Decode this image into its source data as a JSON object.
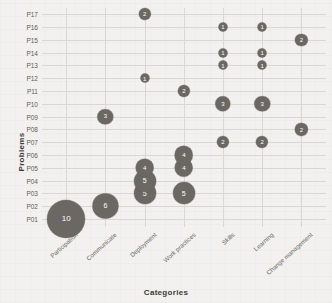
{
  "axis": {
    "y_title": "Problems",
    "x_title": "Categories"
  },
  "chart_data": {
    "type": "scatter",
    "title": "",
    "subtitle": "",
    "xlabel": "Categories",
    "ylabel": "Problems",
    "grid": true,
    "legend": null,
    "marker_style": "bubble-with-value-label",
    "marker_color": "#6b6864",
    "categories": [
      "Participation",
      "Communicate",
      "Deployment",
      "Work practices",
      "Skills",
      "Learning",
      "Change management"
    ],
    "problems": [
      "P01",
      "P02",
      "P03",
      "P04",
      "P05",
      "P06",
      "P07",
      "P08",
      "P09",
      "P10",
      "P11",
      "P12",
      "P13",
      "P14",
      "P15",
      "P16",
      "P17"
    ],
    "xlim": [
      "Participation",
      "Change management"
    ],
    "ylim": [
      "P01",
      "P17"
    ],
    "value_range": [
      1,
      10
    ],
    "points": [
      {
        "x": "Participation",
        "y": "P01",
        "value": 10
      },
      {
        "x": "Communicate",
        "y": "P02",
        "value": 6
      },
      {
        "x": "Communicate",
        "y": "P09",
        "value": 3
      },
      {
        "x": "Deployment",
        "y": "P03",
        "value": 5
      },
      {
        "x": "Deployment",
        "y": "P04",
        "value": 5
      },
      {
        "x": "Deployment",
        "y": "P05",
        "value": 4
      },
      {
        "x": "Deployment",
        "y": "P12",
        "value": 1
      },
      {
        "x": "Deployment",
        "y": "P17",
        "value": 2
      },
      {
        "x": "Work practices",
        "y": "P03",
        "value": 5
      },
      {
        "x": "Work practices",
        "y": "P05",
        "value": 4
      },
      {
        "x": "Work practices",
        "y": "P06",
        "value": 4
      },
      {
        "x": "Work practices",
        "y": "P11",
        "value": 2
      },
      {
        "x": "Skills",
        "y": "P07",
        "value": 2
      },
      {
        "x": "Skills",
        "y": "P10",
        "value": 3
      },
      {
        "x": "Skills",
        "y": "P13",
        "value": 1
      },
      {
        "x": "Skills",
        "y": "P14",
        "value": 1
      },
      {
        "x": "Skills",
        "y": "P16",
        "value": 1
      },
      {
        "x": "Learning",
        "y": "P07",
        "value": 2
      },
      {
        "x": "Learning",
        "y": "P10",
        "value": 3
      },
      {
        "x": "Learning",
        "y": "P13",
        "value": 1
      },
      {
        "x": "Learning",
        "y": "P14",
        "value": 1
      },
      {
        "x": "Learning",
        "y": "P16",
        "value": 1
      },
      {
        "x": "Change management",
        "y": "P08",
        "value": 2
      },
      {
        "x": "Change management",
        "y": "P15",
        "value": 2
      }
    ]
  }
}
